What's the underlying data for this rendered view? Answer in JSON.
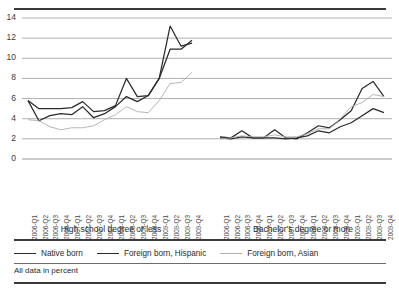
{
  "figure": {
    "title": "",
    "footnote": "All data in percent"
  },
  "legend": {
    "position": "bottom",
    "items": [
      {
        "label": "Native born",
        "color": "#2b2b2b"
      },
      {
        "label": "Foreign born, Hispanic",
        "color": "#2b2b2b"
      },
      {
        "label": "Foreign born, Asian",
        "color": "#adadad"
      }
    ]
  },
  "panels": [
    {
      "label": "High school degree or less"
    },
    {
      "label": "Bachelor's degree or more"
    }
  ],
  "chart_data": {
    "type": "line",
    "title": "",
    "xlabel": "",
    "ylabel": "",
    "ylim": [
      0,
      14
    ],
    "yticks": [
      0,
      2,
      4,
      6,
      8,
      10,
      12,
      14
    ],
    "grid": true,
    "legend_position": "bottom",
    "annotation": "All data in percent",
    "panels": [
      {
        "name": "High school degree or less",
        "x": [
          "2006-Q1",
          "2006-Q2",
          "2006-Q3",
          "2006-Q4",
          "2007-Q1",
          "2007-Q2",
          "2007-Q3",
          "2007-Q4",
          "2008-Q1",
          "2008-Q2",
          "2008-Q3",
          "2008-Q4",
          "2009-Q1",
          "2009-Q2",
          "2009-Q3",
          "2009-Q4"
        ],
        "series": [
          {
            "name": "Native born",
            "color": "#2b2b2b",
            "values": [
              5.8,
              5.0,
              5.0,
              5.0,
              5.1,
              5.7,
              4.7,
              4.8,
              5.3,
              8.0,
              6.2,
              6.3,
              8.0,
              10.9,
              10.9,
              11.8
            ]
          },
          {
            "name": "Foreign born, Hispanic",
            "color": "#2b2b2b",
            "values": [
              5.8,
              3.8,
              4.3,
              4.5,
              4.4,
              5.2,
              4.1,
              4.5,
              5.2,
              6.2,
              5.7,
              6.3,
              8.0,
              13.2,
              11.2,
              11.5
            ]
          },
          {
            "name": "Foreign born, Asian",
            "color": "#adadad",
            "values": [
              3.9,
              3.8,
              3.2,
              2.9,
              3.1,
              3.1,
              3.3,
              3.9,
              4.4,
              5.2,
              4.7,
              4.6,
              5.8,
              7.5,
              7.6,
              8.6
            ]
          }
        ]
      },
      {
        "name": "Bachelor's degree or more",
        "x": [
          "2006-Q1",
          "2006-Q2",
          "2006-Q3",
          "2006-Q4",
          "2007-Q1",
          "2007-Q2",
          "2007-Q3",
          "2007-Q4",
          "2008-Q1",
          "2008-Q2",
          "2008-Q3",
          "2008-Q4",
          "2009-Q1",
          "2009-Q2",
          "2009-Q3",
          "2009-Q4"
        ],
        "series": [
          {
            "name": "Native born",
            "color": "#2b2b2b",
            "values": [
              2.1,
              2.0,
              2.2,
              2.1,
              2.1,
              2.1,
              2.0,
              2.1,
              2.3,
              2.8,
              2.6,
              3.2,
              3.6,
              4.3,
              5.0,
              4.6
            ]
          },
          {
            "name": "Foreign born, Hispanic",
            "color": "#2b2b2b",
            "values": [
              2.2,
              2.1,
              2.8,
              2.1,
              2.1,
              2.9,
              2.1,
              2.0,
              2.6,
              3.3,
              3.1,
              3.9,
              4.8,
              7.0,
              7.7,
              6.2
            ]
          },
          {
            "name": "Foreign born, Asian",
            "color": "#adadad",
            "values": [
              2.0,
              2.1,
              2.3,
              2.2,
              2.2,
              2.4,
              2.2,
              2.2,
              2.5,
              3.0,
              3.0,
              4.0,
              5.2,
              5.6,
              6.4,
              6.2
            ]
          }
        ]
      }
    ]
  }
}
